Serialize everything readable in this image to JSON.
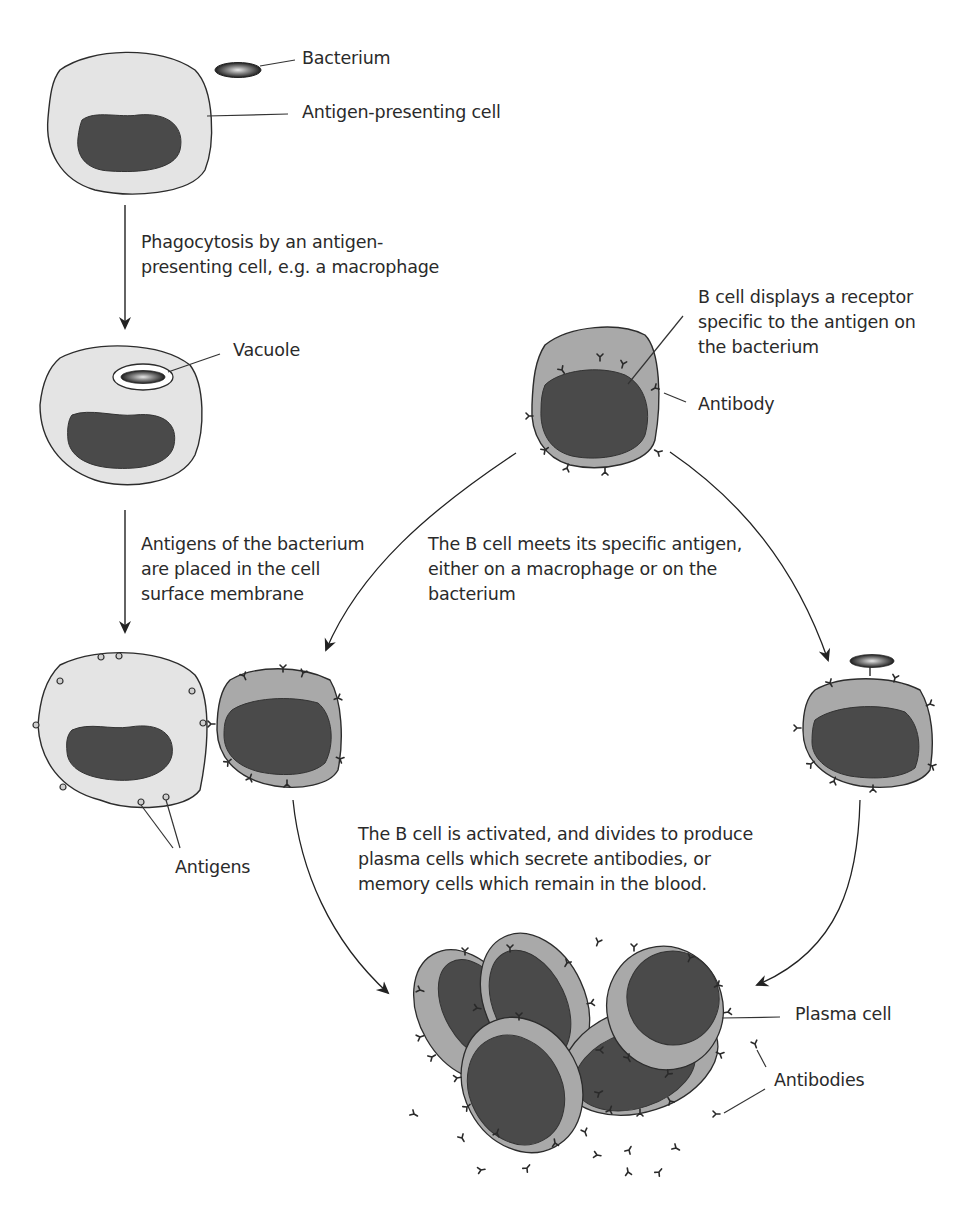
{
  "diagram": {
    "colors": {
      "background": "#ffffff",
      "apc_cytoplasm": "#e4e4e4",
      "b_cell_cytoplasm": "#a9a9a9",
      "nucleus": "#4a4a4a",
      "outline": "#2c2c2c",
      "text": "#2a2a2a"
    },
    "labels": {
      "bacterium": "Bacterium",
      "apc": "Antigen-presenting cell",
      "step1": "Phagocytosis by an antigen-\npresenting cell, e.g. a macrophage",
      "vacuole": "Vacuole",
      "b_cell_desc": "B cell displays a receptor\nspecific to the antigen on\nthe bacterium",
      "antibody": "Antibody",
      "step2": "Antigens of the bacterium\nare placed in the cell\nsurface membrane",
      "step3": "The B cell meets its specific antigen,\neither on a macrophage or on the\nbacterium",
      "antigens": "Antigens",
      "step4": "The B cell is activated, and divides to produce\nplasma cells which secrete antibodies, or\nmemory cells which remain in the blood.",
      "plasma_cell": "Plasma cell",
      "antibodies": "Antibodies"
    },
    "nodes": [
      {
        "id": "apc-with-bacterium",
        "type": "antigen-presenting cell"
      },
      {
        "id": "apc-with-vacuole",
        "type": "antigen-presenting cell"
      },
      {
        "id": "apc-displaying-antigens",
        "type": "antigen-presenting cell"
      },
      {
        "id": "b-cell",
        "type": "B cell"
      },
      {
        "id": "b-cell-bound-to-apc",
        "type": "B cell"
      },
      {
        "id": "b-cell-bound-to-bacterium",
        "type": "B cell"
      },
      {
        "id": "plasma-cell-cluster",
        "type": "plasma cells"
      }
    ],
    "edges": [
      {
        "from": "apc-with-bacterium",
        "to": "apc-with-vacuole",
        "label": "step1"
      },
      {
        "from": "apc-with-vacuole",
        "to": "apc-displaying-antigens",
        "label": "step2"
      },
      {
        "from": "b-cell",
        "to": "b-cell-bound-to-apc",
        "label": "step3"
      },
      {
        "from": "b-cell",
        "to": "b-cell-bound-to-bacterium",
        "label": "step3"
      },
      {
        "from": "b-cell-bound-to-apc",
        "to": "plasma-cell-cluster",
        "label": "step4"
      },
      {
        "from": "b-cell-bound-to-bacterium",
        "to": "plasma-cell-cluster",
        "label": "step4"
      }
    ]
  }
}
